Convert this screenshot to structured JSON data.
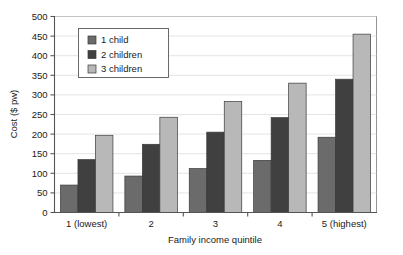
{
  "chart_data": {
    "type": "bar",
    "title": "",
    "subtitle": "",
    "xlabel": "Family income quintile",
    "ylabel": "Cost ($ pw)",
    "categories": [
      "1 (lowest)",
      "2",
      "3",
      "4",
      "5 (highest)"
    ],
    "series": [
      {
        "name": "1 child",
        "values": [
          70,
          93,
          112,
          133,
          192
        ],
        "color": "#6b6b6b"
      },
      {
        "name": "2 children",
        "values": [
          135,
          174,
          205,
          242,
          340
        ],
        "color": "#404040"
      },
      {
        "name": "3 children",
        "values": [
          197,
          243,
          283,
          330,
          455
        ],
        "color": "#b8b8b8"
      }
    ],
    "ylim": [
      0,
      500
    ],
    "ytick_step": 50,
    "yticks": [
      0,
      50,
      100,
      150,
      200,
      250,
      300,
      350,
      400,
      450,
      500
    ],
    "ytick_labels": [
      "0",
      "50",
      "100",
      "150",
      "200",
      "250",
      "300",
      "350",
      "400",
      "450",
      "500"
    ],
    "grid": true,
    "grid_axis": "y",
    "legend_position": "upper-left-inside",
    "legend_entries": [
      "1 child",
      "2 children",
      "3 children"
    ],
    "annotations": []
  },
  "axes": {
    "y_axis_label": "Cost ($ pw)",
    "x_axis_label": "Family income quintile"
  }
}
